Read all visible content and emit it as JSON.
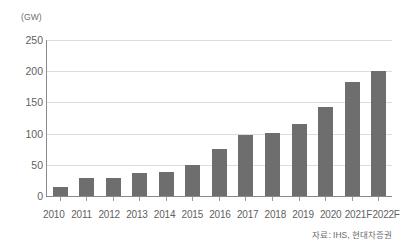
{
  "chart_data": {
    "type": "bar",
    "title": "",
    "subtitle": "",
    "xlabel": "",
    "ylabel": "(GW)",
    "unit_label": "(GW)",
    "categories": [
      "2010",
      "2011",
      "2012",
      "2013",
      "2014",
      "2015",
      "2016",
      "2017",
      "2018",
      "2019",
      "2020",
      "2021F",
      "2022F"
    ],
    "values": [
      15,
      29,
      29,
      37,
      38,
      50,
      75,
      98,
      101,
      115,
      142,
      182,
      200
    ],
    "series": [
      {
        "name": "",
        "values": [
          15,
          29,
          29,
          37,
          38,
          50,
          75,
          98,
          101,
          115,
          142,
          182,
          200
        ]
      }
    ],
    "ylim": [
      0,
      250
    ],
    "ytick_values": [
      0,
      50,
      100,
      150,
      200,
      250
    ],
    "ytick_labels": [
      "0",
      "50",
      "100",
      "150",
      "200",
      "250"
    ],
    "grid": true,
    "grid_axis": "y",
    "legend": false,
    "legend_position": "none",
    "bar_color": "#6e6e6e",
    "grid_color": "#dcdcdc",
    "axis_color": "#8a8a8a",
    "text_color": "#5f5f5f",
    "background_color": "#ffffff"
  },
  "footer": {
    "source": "자료: IHS, 현대차증권"
  }
}
